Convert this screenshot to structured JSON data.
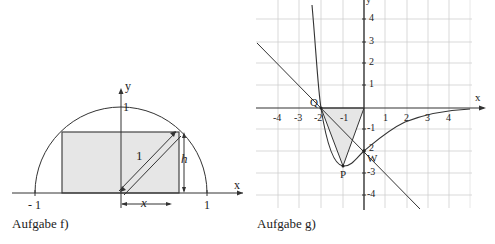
{
  "figure_f": {
    "caption": "Aufgabe f)",
    "axis_x_label": "x",
    "axis_y_label": "y",
    "tick_neg1": "- 1",
    "tick_pos1": "1",
    "tick_y1": "1",
    "diag_label": "1",
    "height_label": "h",
    "width_label": "x",
    "fill_color": "#e6e6e6"
  },
  "figure_g": {
    "caption": "Aufgabe g)",
    "axis_x_label": "x",
    "axis_y_label": "y",
    "x_ticks": [
      "-4",
      "-3",
      "-2",
      "-1",
      "1",
      "2",
      "3",
      "4"
    ],
    "y_ticks": [
      "4",
      "3",
      "2",
      "1",
      "-1",
      "2",
      "-3",
      "-4"
    ],
    "points": {
      "Q": "Q",
      "P": "P",
      "W": "W"
    },
    "fill_color": "#e6e6e6"
  }
}
